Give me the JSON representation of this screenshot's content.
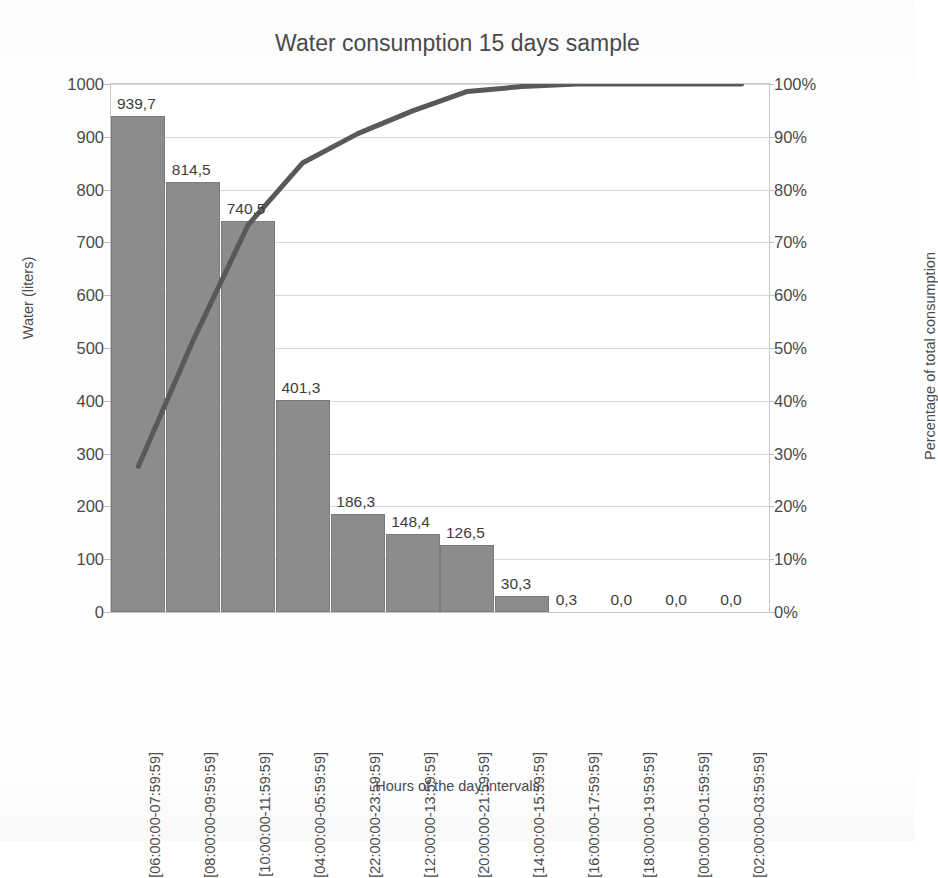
{
  "chart_data": {
    "type": "bar",
    "title": "Water consumption 15 days sample",
    "xlabel": "Hours of the day intervals",
    "ylabel": "Water (liters)",
    "y2label": "Percentage of total consumption",
    "grid": true,
    "legend": "none",
    "ylim": [
      0,
      1000
    ],
    "y2lim": [
      0,
      100
    ],
    "yticks": [
      "0",
      "100",
      "200",
      "300",
      "400",
      "500",
      "600",
      "700",
      "800",
      "900",
      "1000"
    ],
    "y2ticks": [
      "0%",
      "10%",
      "20%",
      "30%",
      "40%",
      "50%",
      "60%",
      "70%",
      "80%",
      "90%",
      "100%"
    ],
    "categories": [
      "[06:00:00-07:59:59]",
      "[08:00:00-09:59:59]",
      "[10:00:00-11:59:59]",
      "[04:00:00-05:59:59]",
      "[22:00:00-23:59:59]",
      "[12:00:00-13:59:59]",
      "[20:00:00-21:59:59]",
      "[14:00:00-15:59:59]",
      "[16:00:00-17:59:59]",
      "[18:00:00-19:59:59]",
      "[00:00:00-01:59:59]",
      "[02:00:00-03:59:59]"
    ],
    "series": [
      {
        "name": "Water (liters)",
        "type": "bar",
        "values": [
          939.7,
          814.5,
          740.5,
          401.3,
          186.3,
          148.4,
          126.5,
          30.3,
          0.3,
          0.0,
          0.0,
          0.0
        ],
        "labels": [
          "939,7",
          "814,5",
          "740,5",
          "401,3",
          "186,3",
          "148,4",
          "126,5",
          "30,3",
          "0,3",
          "0,0",
          "0,0",
          "0,0"
        ],
        "color": "#8c8c8c"
      },
      {
        "name": "Cumulative percentage",
        "type": "line",
        "axis": "right",
        "values": [
          27.6,
          51.5,
          73.3,
          85.1,
          90.6,
          94.9,
          98.6,
          99.5,
          99.99,
          100.0,
          100.0,
          100.0
        ],
        "color": "#595959"
      }
    ]
  }
}
